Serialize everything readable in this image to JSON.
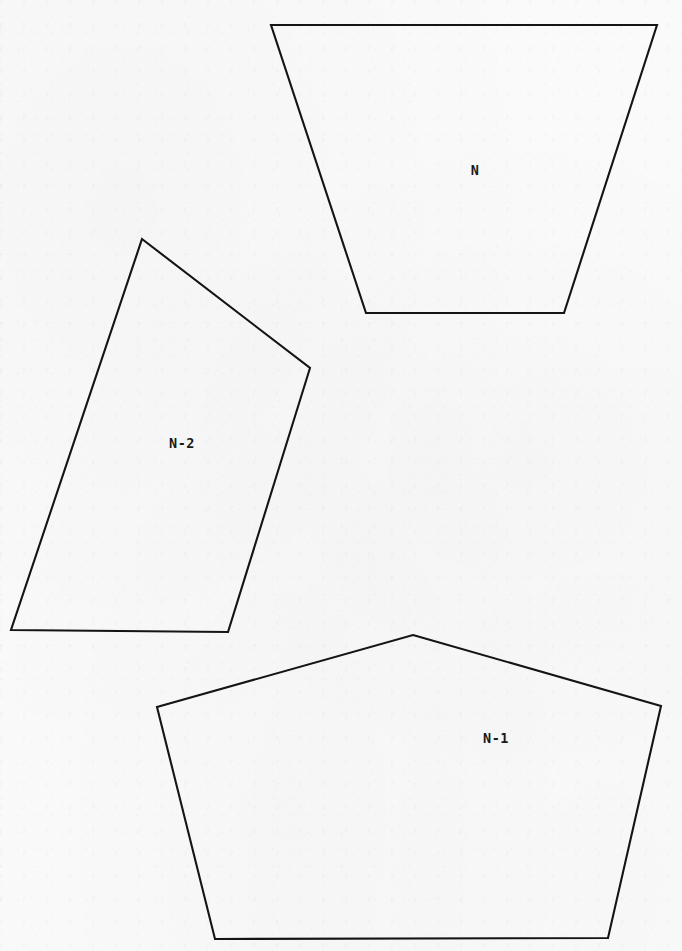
{
  "figure": {
    "canvas": {
      "width": 682,
      "height": 951
    },
    "background_color": "#fafafa",
    "stroke_color": "#141414",
    "label_color": "#1a1a1a",
    "shapes": [
      {
        "id": "polygon-n",
        "label": "N",
        "sides": 4,
        "shape_kind": "trapezoid",
        "points": "271,25 657,25 564,313 366,313",
        "label_x": 475,
        "label_y": 175
      },
      {
        "id": "polygon-n-minus-2",
        "label": "N-2",
        "sides": 4,
        "shape_kind": "quadrilateral",
        "points": "142,239 310,368 228,632 11,630",
        "label_x": 182,
        "label_y": 448
      },
      {
        "id": "polygon-n-minus-1",
        "label": "N-1",
        "sides": 5,
        "shape_kind": "pentagon",
        "points": "413,635 661,706 608,938 215,939 157,707",
        "label_x": 496,
        "label_y": 743
      }
    ]
  }
}
